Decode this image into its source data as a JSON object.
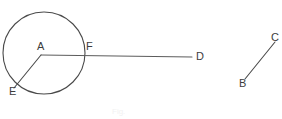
{
  "figure": {
    "background_color": "#ffffff",
    "stroke_color": "#4a4a4a",
    "width": 282,
    "height": 119,
    "circle": {
      "name": "circle-A",
      "center_x": 44,
      "center_y": 53,
      "radius": 41
    },
    "points": [
      {
        "id": "A",
        "label": "A",
        "x": 41,
        "y": 55,
        "label_x": 37,
        "label_y": 41
      },
      {
        "id": "F",
        "label": "F",
        "x": 84,
        "y": 53,
        "label_x": 86,
        "label_y": 41
      },
      {
        "id": "D",
        "label": "D",
        "x": 192,
        "y": 57,
        "label_x": 196,
        "label_y": 51
      },
      {
        "id": "E",
        "label": "E",
        "x": 14,
        "y": 88,
        "label_x": 9,
        "label_y": 86
      },
      {
        "id": "B",
        "label": "B",
        "x": 245,
        "y": 79,
        "label_x": 239,
        "label_y": 78
      },
      {
        "id": "C",
        "label": "C",
        "x": 275,
        "y": 42,
        "label_x": 271,
        "label_y": 32
      }
    ],
    "segments": [
      {
        "name": "segment-AD",
        "from": "A",
        "to": "D"
      },
      {
        "name": "segment-AE",
        "from": "A",
        "to": "E"
      },
      {
        "name": "segment-BC",
        "from": "B",
        "to": "C"
      }
    ],
    "caption": "Fig."
  }
}
